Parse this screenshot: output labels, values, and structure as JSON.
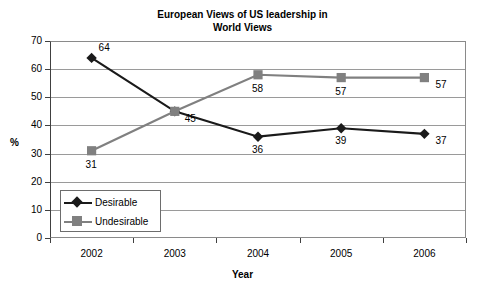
{
  "chart_data": {
    "type": "line",
    "title": "European Views of US leadership in World Views",
    "title_lines": [
      "European Views of US leadership in",
      "World Views"
    ],
    "xlabel": "Year",
    "ylabel": "%",
    "categories": [
      "2002",
      "2003",
      "2004",
      "2005",
      "2006"
    ],
    "ylim": [
      0,
      70
    ],
    "yticks": [
      "0",
      "10",
      "20",
      "30",
      "40",
      "50",
      "60",
      "70"
    ],
    "grid": true,
    "legend_position": "inside-bottom-left",
    "series": [
      {
        "name": "Desirable",
        "color": "#1a1a1a",
        "marker": "diamond",
        "values": [
          64,
          45,
          36,
          39,
          37
        ],
        "labels": [
          "64",
          "45",
          "36",
          "39",
          "37"
        ]
      },
      {
        "name": "Undesirable",
        "color": "#808080",
        "marker": "square",
        "values": [
          31,
          45,
          58,
          57,
          57
        ],
        "labels": [
          "31",
          "45",
          "58",
          "57",
          "57"
        ]
      }
    ]
  },
  "legend": {
    "items": [
      {
        "label": "Desirable"
      },
      {
        "label": "Undesirable"
      }
    ]
  }
}
